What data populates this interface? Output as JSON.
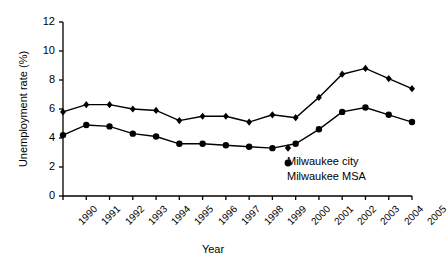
{
  "chart_data": {
    "type": "line",
    "title": "",
    "xlabel": "Year",
    "ylabel": "Unemployment rate (%)",
    "x": [
      1990,
      1991,
      1992,
      1993,
      1994,
      1995,
      1996,
      1997,
      1998,
      1999,
      2000,
      2001,
      2002,
      2003,
      2004,
      2005
    ],
    "categories": [
      "1990",
      "1991",
      "1992",
      "1993",
      "1994",
      "1995",
      "1996",
      "1997",
      "1998",
      "1999",
      "2000",
      "2001",
      "2002",
      "2003",
      "2004",
      "2005"
    ],
    "xlim": [
      1990,
      2005
    ],
    "ylim": [
      0,
      12
    ],
    "yticks": [
      0,
      2,
      4,
      6,
      8,
      10,
      12
    ],
    "ytick_labels": [
      "0",
      "2",
      "4",
      "6",
      "8",
      "10",
      "12"
    ],
    "grid": false,
    "legend_position": "inside-bottom-right",
    "series": [
      {
        "name": "Milwaukee city",
        "marker": "diamond",
        "color": "#000000",
        "values": [
          5.8,
          6.3,
          6.3,
          6.0,
          5.9,
          5.2,
          5.5,
          5.5,
          5.1,
          5.6,
          5.4,
          6.8,
          8.4,
          8.8,
          8.1,
          7.4
        ]
      },
      {
        "name": "Milwaukee MSA",
        "marker": "circle",
        "color": "#000000",
        "values": [
          4.2,
          4.9,
          4.8,
          4.3,
          4.1,
          3.6,
          3.6,
          3.5,
          3.4,
          3.3,
          3.6,
          4.6,
          5.8,
          6.1,
          5.6,
          5.1
        ]
      }
    ]
  },
  "legend": {
    "items": [
      {
        "label": "Milwaukee city",
        "marker": "diamond"
      },
      {
        "label": "Milwaukee MSA",
        "marker": "circle"
      }
    ]
  }
}
